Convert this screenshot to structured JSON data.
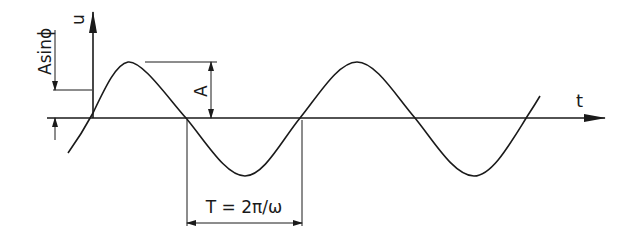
{
  "diagram": {
    "type": "sine-wave",
    "axes": {
      "vertical_label": "u",
      "horizontal_label": "t"
    },
    "annotations": {
      "phase_offset": "Asinϕ",
      "amplitude": "A",
      "period": "T = 2π/ω"
    },
    "colors": {
      "stroke": "#1a1a1a",
      "background": "#ffffff"
    }
  }
}
